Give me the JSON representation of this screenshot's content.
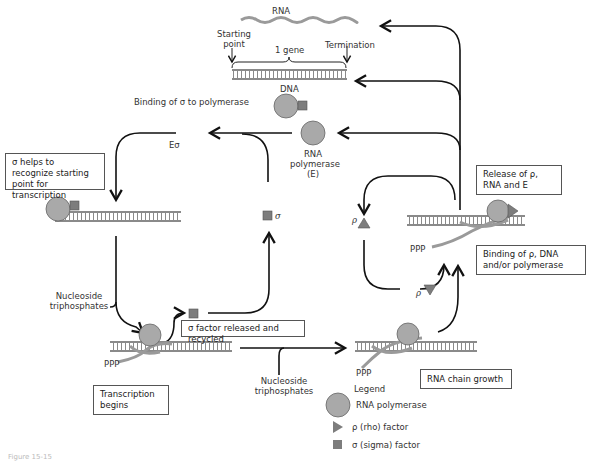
{
  "labels": {
    "rna_top": "RNA",
    "starting_point_1": "Starting",
    "starting_point_2": "point",
    "one_gene": "1 gene",
    "termination": "Termination",
    "dna": "DNA",
    "binding_sigma": "Binding of σ to polymerase",
    "e_sigma": "Eσ",
    "rna_polymerase_1": "RNA",
    "rna_polymerase_2": "polymerase",
    "rna_polymerase_3": "(E)",
    "sigma_free": "σ",
    "rho_up": "ρ",
    "rho_down": "ρ",
    "nucleoside_left_1": "Nucleoside",
    "nucleoside_left_2": "triphosphates",
    "nucleoside_mid_1": "Nucleoside",
    "nucleoside_mid_2": "triphosphates",
    "ppp_left": "PPP",
    "ppp_mid": "PPP",
    "ppp_right": "PPP"
  },
  "boxes": {
    "sigma_helps": "σ helps to recognize starting point for transcription",
    "sigma_released": "σ factor released and recycled",
    "transcription_begins": "Transcription begins",
    "rna_chain_growth": "RNA chain growth",
    "release_rho": "Release of ρ, RNA and E",
    "binding_rho": "Binding of ρ, DNA and/or polymerase"
  },
  "legend": {
    "title": "Legend",
    "items": [
      {
        "icon": "circle",
        "label": "RNA polymerase"
      },
      {
        "icon": "triangle",
        "label": "ρ (rho) factor"
      },
      {
        "icon": "square",
        "label": "σ (sigma) factor"
      }
    ]
  },
  "caption": "Figure 15-15",
  "colors": {
    "polymerase": "#a9a9a9",
    "factor": "#7d7d7d",
    "rna_strand": "#9a9a9a",
    "dna": "#8a8a8a",
    "line": "#111111"
  }
}
